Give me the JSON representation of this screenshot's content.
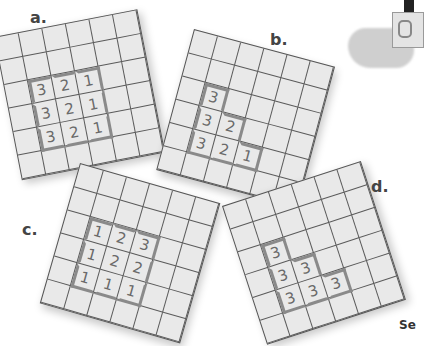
{
  "puzzles": [
    {
      "label": "a.",
      "grid": [
        [
          "",
          "",
          "",
          "",
          "",
          ""
        ],
        [
          "",
          "",
          "",
          "",
          "",
          ""
        ],
        [
          "",
          "3",
          "2",
          "1",
          "",
          ""
        ],
        [
          "",
          "3",
          "2",
          "1",
          "",
          ""
        ],
        [
          "",
          "3",
          "2",
          "1",
          "",
          ""
        ],
        [
          "",
          "",
          "",
          "",
          "",
          ""
        ]
      ]
    },
    {
      "label": "b.",
      "grid": [
        [
          "",
          "",
          "",
          "",
          "",
          ""
        ],
        [
          "",
          "",
          "",
          "",
          "",
          ""
        ],
        [
          "",
          "3",
          "",
          "",
          "",
          ""
        ],
        [
          "",
          "3",
          "2",
          "",
          "",
          ""
        ],
        [
          "",
          "3",
          "2",
          "1",
          "",
          ""
        ],
        [
          "",
          "",
          "",
          "",
          "",
          ""
        ]
      ]
    },
    {
      "label": "c.",
      "grid": [
        [
          "",
          "",
          "",
          "",
          "",
          ""
        ],
        [
          "",
          "",
          "",
          "",
          "",
          ""
        ],
        [
          "",
          "1",
          "2",
          "3",
          "",
          ""
        ],
        [
          "",
          "1",
          "2",
          "2",
          "",
          ""
        ],
        [
          "",
          "1",
          "1",
          "1",
          "",
          ""
        ],
        [
          "",
          "",
          "",
          "",
          "",
          ""
        ]
      ]
    },
    {
      "label": "d.",
      "grid": [
        [
          "",
          "",
          "",
          "",
          "",
          ""
        ],
        [
          "",
          "",
          "",
          "",
          "",
          ""
        ],
        [
          "",
          "3",
          "",
          "",
          "",
          ""
        ],
        [
          "",
          "3",
          "3",
          "",
          "",
          ""
        ],
        [
          "",
          "3",
          "3",
          "3",
          "",
          ""
        ],
        [
          "",
          "",
          "",
          "",
          "",
          ""
        ]
      ]
    }
  ],
  "footer_text": "Se",
  "colors": {
    "cell_fill": "#e9e9e9",
    "grid_line": "#5a5a5a",
    "highlight_border": "#8a8a8a",
    "digit": "#6a6a6a"
  }
}
